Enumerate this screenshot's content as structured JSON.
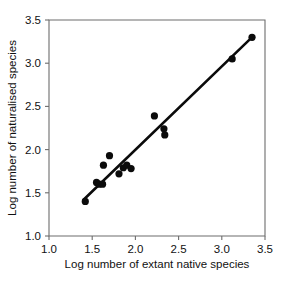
{
  "chart_data": {
    "type": "scatter",
    "title": "",
    "xlabel": "Log number of extant native species",
    "ylabel": "Log number of naturalised species",
    "xlim": [
      1.0,
      3.5
    ],
    "ylim": [
      1.0,
      3.5
    ],
    "xticks": [
      "1.0",
      "1.5",
      "2.0",
      "2.5",
      "3.0",
      "3.5"
    ],
    "yticks": [
      "1.0",
      "1.5",
      "2.0",
      "2.5",
      "3.0",
      "3.5"
    ],
    "xtick_values": [
      1.0,
      1.5,
      2.0,
      2.5,
      3.0,
      3.5
    ],
    "ytick_values": [
      1.0,
      1.5,
      2.0,
      2.5,
      3.0,
      3.5
    ],
    "grid": false,
    "legend": null,
    "marker": "filled-circle",
    "marker_color": "#0b0b0b",
    "marker_size": 7.2,
    "points": [
      {
        "x": 1.42,
        "y": 1.4
      },
      {
        "x": 1.55,
        "y": 1.62
      },
      {
        "x": 1.58,
        "y": 1.6
      },
      {
        "x": 1.62,
        "y": 1.6
      },
      {
        "x": 1.63,
        "y": 1.82
      },
      {
        "x": 1.7,
        "y": 1.93
      },
      {
        "x": 1.81,
        "y": 1.72
      },
      {
        "x": 1.86,
        "y": 1.79
      },
      {
        "x": 1.9,
        "y": 1.82
      },
      {
        "x": 1.95,
        "y": 1.78
      },
      {
        "x": 2.22,
        "y": 2.39
      },
      {
        "x": 2.33,
        "y": 2.24
      },
      {
        "x": 2.34,
        "y": 2.17
      },
      {
        "x": 3.12,
        "y": 3.05
      },
      {
        "x": 3.35,
        "y": 3.3
      }
    ],
    "fit_line": {
      "type": "linear-regression",
      "x_start": 1.4,
      "y_start": 1.42,
      "x_end": 3.36,
      "y_end": 3.31,
      "color": "#0b0b0b"
    }
  },
  "axes": {
    "x_axis_name": "x-axis",
    "y_axis_name": "y-axis"
  }
}
